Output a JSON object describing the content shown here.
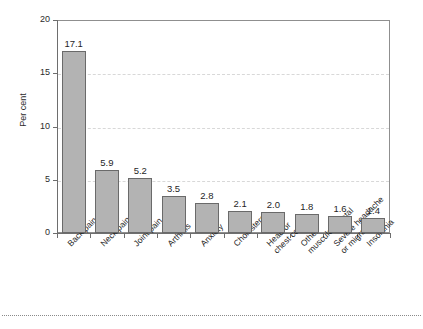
{
  "chart_data": {
    "type": "bar",
    "title": "",
    "subtitle": "",
    "xlabel": "",
    "ylabel": "Per cent",
    "ylim": [
      0,
      20
    ],
    "ytick_labels": [
      "0",
      "5",
      "10",
      "15",
      "20"
    ],
    "ytick_values": [
      0,
      5,
      10,
      15,
      20
    ],
    "grid": "horizontal-dashed",
    "legend": "none",
    "categories": [
      "Back pain",
      "Neck pain",
      "Joint pain",
      "Arthritis",
      "Anxiety",
      "Cholesterol",
      "Head or\nchest cold",
      "Other\nmusculoskeletal",
      "Severe headache\nor migraine",
      "Insomnia"
    ],
    "values": [
      17.1,
      5.9,
      5.2,
      3.5,
      2.8,
      2.1,
      2.0,
      1.8,
      1.6,
      1.4
    ],
    "value_labels": [
      "17.1",
      "5.9",
      "5.2",
      "3.5",
      "2.8",
      "2.1",
      "2.0",
      "1.8",
      "1.6",
      "1.4"
    ],
    "bar_color": "#b3b3b3",
    "bar_edge_color": "#6a6a6a",
    "axis_color": "#6e6e6e",
    "grid_color": "#d8d8d8",
    "text_color": "#1f1f1f"
  }
}
